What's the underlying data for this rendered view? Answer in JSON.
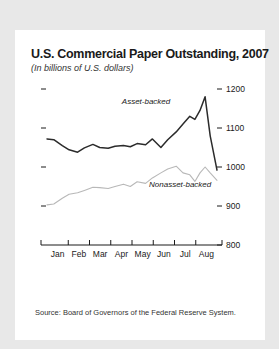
{
  "card": {
    "title": "U.S. Commercial Paper Outstanding, 2007",
    "subtitle": "(In billions of U.S. dollars)",
    "source": "Source: Board of Governors of the Federal Reserve System."
  },
  "chart_data": {
    "type": "line",
    "title": "U.S. Commercial Paper Outstanding, 2007",
    "subtitle": "(In billions of U.S. dollars)",
    "xlabel": "",
    "ylabel": "",
    "ylim": [
      800,
      1200
    ],
    "yticks": [
      800,
      900,
      1000,
      1100,
      1200
    ],
    "ytick_labels": [
      "800",
      "900",
      "1000",
      "1100",
      "1200"
    ],
    "yaxis_position": "right",
    "grid": false,
    "categories": [
      "Jan",
      "Feb",
      "Mar",
      "Apr",
      "May",
      "Jun",
      "Jul",
      "Aug"
    ],
    "legend_position": "inline-annotation",
    "series": [
      {
        "name": "Asset-backed",
        "color": "#2b2b2b",
        "label_x_frac": 0.44,
        "label_y_value": 1163,
        "x": [
          0.0,
          0.04,
          0.09,
          0.13,
          0.18,
          0.22,
          0.27,
          0.31,
          0.36,
          0.4,
          0.45,
          0.49,
          0.53,
          0.58,
          0.62,
          0.67,
          0.71,
          0.76,
          0.8,
          0.84,
          0.87,
          0.9,
          0.93,
          0.96,
          1.0
        ],
        "values": [
          1072,
          1070,
          1055,
          1044,
          1038,
          1049,
          1058,
          1050,
          1048,
          1053,
          1055,
          1052,
          1060,
          1057,
          1072,
          1050,
          1070,
          1090,
          1110,
          1130,
          1122,
          1145,
          1180,
          1080,
          992
        ]
      },
      {
        "name": "Nonasset-backed",
        "color": "#b8b8b8",
        "label_x_frac": 0.6,
        "label_y_value": 952,
        "x": [
          0.0,
          0.04,
          0.09,
          0.13,
          0.18,
          0.22,
          0.27,
          0.31,
          0.36,
          0.4,
          0.45,
          0.49,
          0.53,
          0.58,
          0.62,
          0.67,
          0.71,
          0.76,
          0.8,
          0.84,
          0.87,
          0.9,
          0.93,
          0.96,
          1.0
        ],
        "values": [
          903,
          905,
          920,
          930,
          934,
          940,
          948,
          947,
          945,
          950,
          956,
          950,
          962,
          958,
          972,
          985,
          995,
          1002,
          985,
          980,
          963,
          985,
          1000,
          985,
          966
        ]
      }
    ],
    "ticks_left_unlabeled": [
      1200,
      1100,
      1000,
      900
    ]
  }
}
